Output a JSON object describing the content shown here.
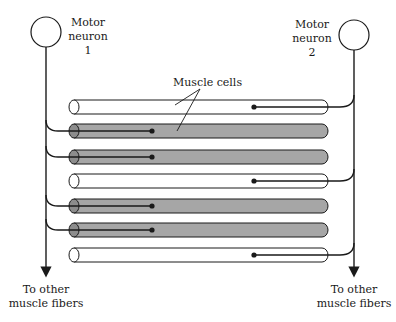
{
  "diagram": {
    "neurons": [
      {
        "id": 1,
        "label_lines": [
          "Motor",
          "neuron",
          "1"
        ]
      },
      {
        "id": 2,
        "label_lines": [
          "Motor",
          "neuron",
          "2"
        ]
      }
    ],
    "muscle_cells_label": "Muscle cells",
    "bottom_labels": {
      "left": [
        "To other",
        "muscle fibers"
      ],
      "right": [
        "To other",
        "muscle fibers"
      ]
    },
    "fibers": [
      {
        "row": 1,
        "innervated_by": 2,
        "shaded": false
      },
      {
        "row": 2,
        "innervated_by": 1,
        "shaded": true
      },
      {
        "row": 3,
        "innervated_by": 1,
        "shaded": true
      },
      {
        "row": 4,
        "innervated_by": 2,
        "shaded": false
      },
      {
        "row": 5,
        "innervated_by": 1,
        "shaded": true
      },
      {
        "row": 6,
        "innervated_by": 1,
        "shaded": true
      },
      {
        "row": 7,
        "innervated_by": 2,
        "shaded": false
      }
    ],
    "colors": {
      "shaded_fill": "#a6a6a6",
      "unshaded_fill": "#ffffff",
      "line": "#1a1a1a"
    }
  }
}
